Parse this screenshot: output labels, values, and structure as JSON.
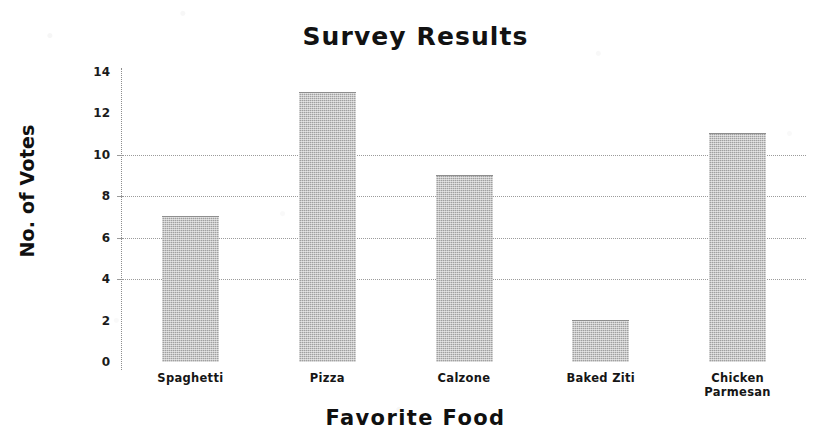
{
  "chart_data": {
    "type": "bar",
    "title": "Survey Results",
    "xlabel": "Favorite Food",
    "ylabel": "No. of Votes",
    "categories": [
      "Spaghetti",
      "Pizza",
      "Calzone",
      "Baked Ziti",
      "Chicken Parmesan"
    ],
    "values": [
      7,
      13,
      9,
      2,
      11
    ],
    "ylim": [
      0,
      14
    ],
    "yticks": [
      0,
      2,
      4,
      6,
      8,
      10,
      12,
      14
    ],
    "ytick_labels": [
      "0",
      "2",
      "4",
      "6",
      "8",
      "10",
      "12",
      "14"
    ],
    "grid": true,
    "gridlines_at": [
      4,
      6,
      8,
      10
    ],
    "legend": null,
    "bar_color": "#a0a0a0",
    "text_color": "#111111",
    "background_color": "#ffffff"
  },
  "category_label_lines": [
    [
      "Spaghetti"
    ],
    [
      "Pizza"
    ],
    [
      "Calzone"
    ],
    [
      "Baked Ziti"
    ],
    [
      "Chicken",
      "Parmesan"
    ]
  ]
}
